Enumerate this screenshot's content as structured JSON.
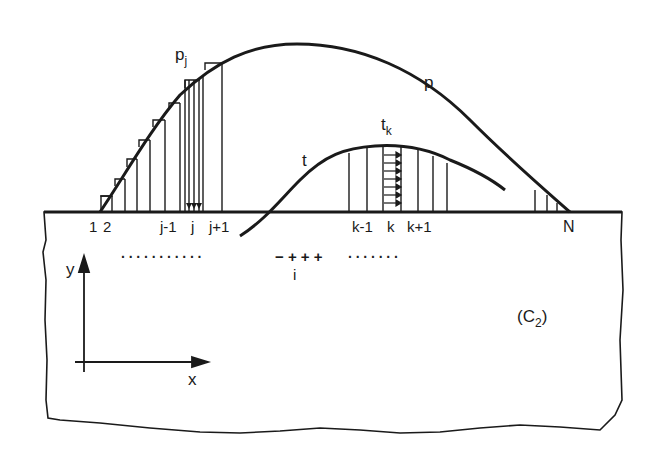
{
  "diagram": {
    "curves": {
      "p": {
        "label": "p",
        "point_label": "p",
        "point_sub": "j"
      },
      "t": {
        "label": "t",
        "point_label": "t",
        "point_sub": "k"
      }
    },
    "boundary_labels": {
      "n1": "1",
      "n2": "2",
      "jm1": "j-1",
      "j": "j",
      "jp1": "j+1",
      "km1": "k-1",
      "k": "k",
      "kp1": "k+1",
      "N": "N"
    },
    "row_markers": {
      "dots_left": "···········",
      "signs": "− + + +",
      "dots_right": "·······",
      "i_label": "i"
    },
    "axes": {
      "x_label": "x",
      "y_label": "y"
    },
    "region": {
      "label": "(C",
      "sub": "2",
      "close": ")"
    },
    "colors": {
      "ink": "#1a1a1a",
      "background": "#ffffff"
    }
  }
}
